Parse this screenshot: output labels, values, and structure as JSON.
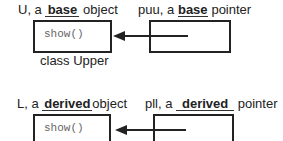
{
  "top": {
    "object_label": {
      "prefix": "U, a",
      "blank": "base",
      "suffix": "object"
    },
    "pointer_label": {
      "prefix": "puu, a",
      "blank": "base",
      "suffix": "pointer"
    },
    "method": "show()",
    "caption": "class Upper"
  },
  "bottom": {
    "object_label": {
      "prefix": "L, a",
      "blank": "derived",
      "suffix": "object"
    },
    "pointer_label": {
      "prefix": "pll, a",
      "blank": "derived",
      "suffix": "pointer"
    },
    "method": "show()"
  }
}
